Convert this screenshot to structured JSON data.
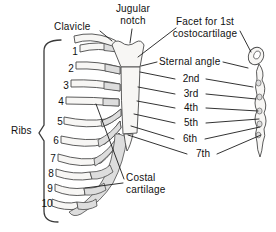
{
  "labels": {
    "clavicle": "Clavicle",
    "jugular_notch": "Jugular notch",
    "facet_for_1st_costocartilage": "Facet for 1st costocartilage",
    "sternal_angle": "Sternal angle",
    "ribs": "Ribs",
    "costal_cartilage": "Costal cartilage"
  },
  "costal_facet_labels": [
    "2nd",
    "3rd",
    "4th",
    "5th",
    "6th",
    "7th"
  ],
  "rib_numbers": [
    "1",
    "2",
    "3",
    "4",
    "5",
    "6",
    "7",
    "8",
    "9",
    "10"
  ],
  "colors": {
    "background": "#ffffff",
    "outline": "#4a4a4a",
    "leader_line": "#1c1c1c",
    "bone_fill": "#f7f6f4",
    "cartilage_fill": "#dddddd",
    "text": "#111111"
  }
}
